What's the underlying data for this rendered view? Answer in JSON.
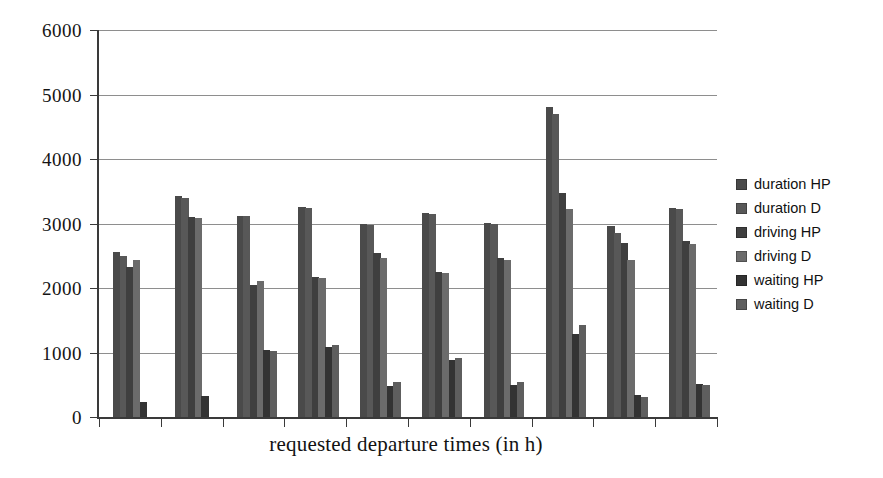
{
  "chart_data": {
    "type": "bar",
    "title": "",
    "subtitle": "",
    "xlabel": "requested departure times (in h)",
    "ylabel": "",
    "ylim": [
      0,
      6000
    ],
    "ytick_labels": [
      "6000",
      "5000",
      "4000",
      "3000",
      "2000",
      "1000",
      "0"
    ],
    "ytick_values": [
      6000,
      5000,
      4000,
      3000,
      2000,
      1000,
      0
    ],
    "grid": true,
    "xtick_labels": [
      "",
      "",
      "",
      "",
      "",
      "",
      "",
      "",
      "",
      ""
    ],
    "legend_position": "right",
    "categories": [
      "1",
      "2",
      "3",
      "4",
      "5",
      "6",
      "7",
      "8",
      "9",
      "10"
    ],
    "series": [
      {
        "name": "duration HP",
        "color": "#4a4a4a",
        "values": [
          2560,
          3420,
          3120,
          3260,
          3000,
          3160,
          3010,
          4810,
          2960,
          3240
        ]
      },
      {
        "name": "duration D",
        "color": "#585858",
        "values": [
          2500,
          3400,
          3110,
          3240,
          2980,
          3140,
          2990,
          4700,
          2860,
          3230
        ]
      },
      {
        "name": "driving HP",
        "color": "#3f3f3f",
        "values": [
          2330,
          3100,
          2050,
          2170,
          2540,
          2250,
          2470,
          3480,
          2700,
          2730
        ]
      },
      {
        "name": "driving D",
        "color": "#6b6b6b",
        "values": [
          2440,
          3090,
          2110,
          2150,
          2460,
          2230,
          2440,
          3220,
          2440,
          2690
        ]
      },
      {
        "name": "waiting HP",
        "color": "#333333",
        "values": [
          240,
          320,
          1040,
          1090,
          480,
          880,
          500,
          1280,
          340,
          510
        ]
      },
      {
        "name": "waiting D",
        "color": "#5e5e5e",
        "values": [
          0,
          0,
          1020,
          1110,
          540,
          910,
          540,
          1430,
          310,
          500
        ]
      }
    ]
  },
  "legend": {
    "items": [
      {
        "label": "duration HP",
        "swatch": "#4a4a4a"
      },
      {
        "label": "duration D",
        "swatch": "#585858"
      },
      {
        "label": "driving HP",
        "swatch": "#3f3f3f"
      },
      {
        "label": "driving D",
        "swatch": "#6b6b6b"
      },
      {
        "label": "waiting HP",
        "swatch": "#333333"
      },
      {
        "label": "waiting D",
        "swatch": "#5e5e5e"
      }
    ]
  },
  "axes": {
    "x_title": "requested departure times (in h)"
  }
}
